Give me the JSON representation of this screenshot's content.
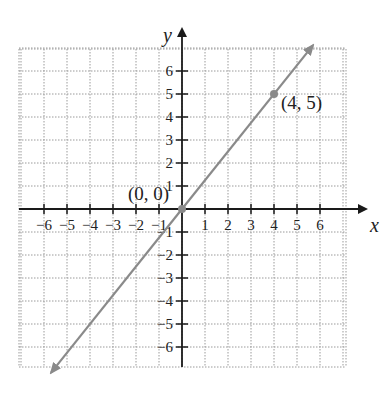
{
  "chart_data": {
    "type": "line",
    "title": "",
    "xlabel": "x",
    "ylabel": "y",
    "xlim": [
      -7,
      7
    ],
    "ylim": [
      -7,
      7
    ],
    "grid": true,
    "x_ticks": [
      -6,
      -5,
      -4,
      -3,
      -2,
      -1,
      1,
      2,
      3,
      4,
      5,
      6
    ],
    "y_ticks": [
      -6,
      -5,
      -4,
      -3,
      -2,
      -1,
      1,
      2,
      3,
      4,
      5,
      6
    ],
    "x_tick_labels": [
      "−6",
      "−5",
      "−4",
      "−3",
      "−2",
      "−1",
      "1",
      "2",
      "3",
      "4",
      "5",
      "6"
    ],
    "y_tick_labels": [
      "−6",
      "−5",
      "−4",
      "−3",
      "−2",
      "−1",
      "1",
      "2",
      "3",
      "4",
      "5",
      "6"
    ],
    "series": [
      {
        "name": "line through origin",
        "equation": "y = 5/4 x",
        "slope": 1.25,
        "intercept": 0,
        "x": [
          -5.7,
          5.7
        ],
        "y": [
          -7.125,
          7.125
        ],
        "color": "#8a8a8a",
        "arrows": "both"
      }
    ],
    "points": [
      {
        "x": 0,
        "y": 0,
        "label": "(0, 0)"
      },
      {
        "x": 4,
        "y": 5,
        "label": "(4, 5)"
      }
    ],
    "annotations": [
      "(0, 0)",
      "(4, 5)"
    ]
  },
  "labels": {
    "x_axis": "x",
    "y_axis": "y",
    "origin": "(0, 0)",
    "point": "(4, 5)"
  },
  "colors": {
    "axis": "#1a1a1a",
    "grid": "#9a9a9a",
    "line": "#8a8a8a",
    "point": "#8a8a8a"
  }
}
